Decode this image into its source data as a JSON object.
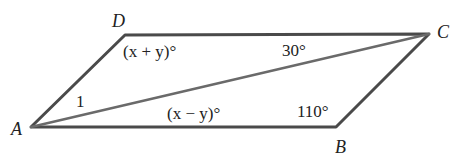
{
  "figure": {
    "vertices": {
      "A": "A",
      "B": "B",
      "C": "C",
      "D": "D"
    },
    "angles": {
      "D": "(x + y)°",
      "DCA": "30°",
      "DAC": "1",
      "CAB": "(x − y)°",
      "B": "110°"
    }
  }
}
